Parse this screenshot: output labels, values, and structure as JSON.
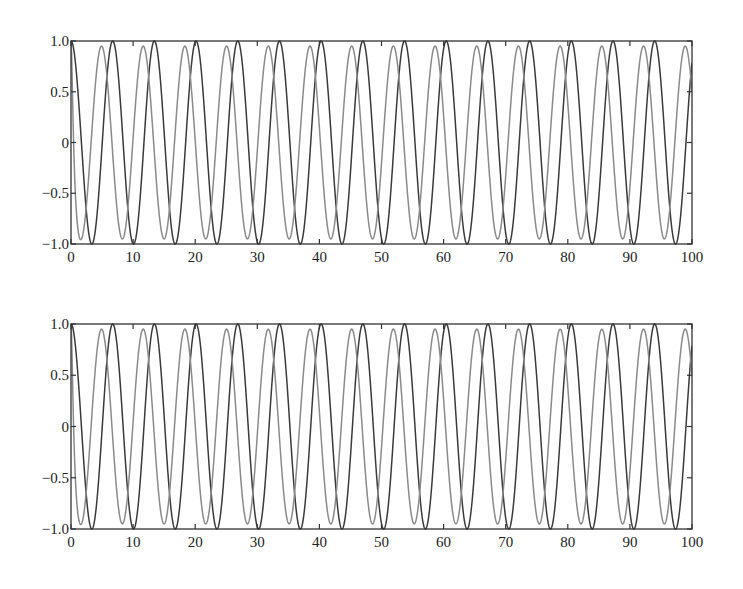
{
  "chart_data": [
    {
      "type": "line",
      "title": "",
      "xlabel": "",
      "ylabel": "",
      "xlim": [
        0,
        100
      ],
      "ylim": [
        -1.0,
        1.0
      ],
      "grid": false,
      "legend": null,
      "x_ticks": [
        0,
        10,
        20,
        30,
        40,
        50,
        60,
        70,
        80,
        90,
        100
      ],
      "x_tick_labels": [
        "0",
        "10",
        "20",
        "30",
        "40",
        "50",
        "60",
        "70",
        "80",
        "90",
        "100"
      ],
      "y_ticks": [
        1.0,
        0.5,
        0,
        -0.5,
        -1.0
      ],
      "y_tick_labels": [
        "1.0",
        "0.5",
        "0",
        "−0.5",
        "−1.0"
      ],
      "series": [
        {
          "name": "dark",
          "color": "#3a3a3a",
          "description": "cosine, amplitude 1.0, period ~6.71, starts at 1.0",
          "amplitude": 1.0,
          "period": 6.714,
          "phase_shift": 0,
          "peaks_x": [
            0,
            6.7,
            13.4,
            20.1,
            26.9,
            33.6,
            40.3,
            47.0,
            53.7,
            60.4,
            67.1,
            73.9,
            80.6,
            87.3,
            94.0
          ],
          "troughs_x": [
            3.4,
            10.1,
            16.8,
            23.5,
            30.2,
            36.9,
            43.6,
            50.4,
            57.1,
            63.8,
            70.5,
            77.2,
            83.9,
            90.6,
            97.3
          ]
        },
        {
          "name": "light",
          "color": "#8a8a8a",
          "description": "cosine, amplitude ~0.95, same period, leads dark curve by ~1.8, starts at 1.0",
          "amplitude": 0.95,
          "period": 6.714,
          "phase_shift": 1.8,
          "peaks_x": [
            5.0,
            11.7,
            18.4,
            25.1,
            31.8,
            38.5,
            45.2,
            51.9,
            58.6,
            65.4,
            72.1,
            78.8,
            85.5,
            92.2,
            98.9
          ],
          "troughs_x": [
            1.6,
            8.3,
            15.0,
            21.7,
            28.5,
            35.2,
            41.9,
            48.6,
            55.3,
            62.0,
            68.7,
            75.4,
            82.2,
            88.9,
            95.6
          ]
        }
      ]
    },
    {
      "type": "line",
      "title": "",
      "xlabel": "",
      "ylabel": "",
      "xlim": [
        0,
        100
      ],
      "ylim": [
        -1.0,
        1.0
      ],
      "grid": false,
      "legend": null,
      "x_ticks": [
        0,
        10,
        20,
        30,
        40,
        50,
        60,
        70,
        80,
        90,
        100
      ],
      "x_tick_labels": [
        "0",
        "10",
        "20",
        "30",
        "40",
        "50",
        "60",
        "70",
        "80",
        "90",
        "100"
      ],
      "y_ticks": [
        1.0,
        0.5,
        0,
        -0.5,
        -1.0
      ],
      "y_tick_labels": [
        "1.0",
        "0.5",
        "0",
        "−0.5",
        "−1.0"
      ],
      "series": [
        {
          "name": "dark",
          "color": "#3a3a3a",
          "description": "cosine, amplitude 1.0, period ~6.71, starts at 1.0",
          "amplitude": 1.0,
          "period": 6.714,
          "phase_shift": 0,
          "peaks_x": [
            0,
            6.7,
            13.4,
            20.1,
            26.9,
            33.6,
            40.3,
            47.0,
            53.7,
            60.4,
            67.1,
            73.9,
            80.6,
            87.3,
            94.0
          ],
          "troughs_x": [
            3.4,
            10.1,
            16.8,
            23.5,
            30.2,
            36.9,
            43.6,
            50.4,
            57.1,
            63.8,
            70.5,
            77.2,
            83.9,
            90.6,
            97.3
          ]
        },
        {
          "name": "light",
          "color": "#8a8a8a",
          "description": "cosine, amplitude ~0.95, same period, leads dark curve by ~1.8, starts at 1.0",
          "amplitude": 0.95,
          "period": 6.714,
          "phase_shift": 1.8,
          "peaks_x": [
            5.0,
            11.7,
            18.4,
            25.1,
            31.8,
            38.5,
            45.2,
            51.9,
            58.6,
            65.4,
            72.1,
            78.8,
            85.5,
            92.2,
            98.9
          ],
          "troughs_x": [
            1.6,
            8.3,
            15.0,
            21.7,
            28.5,
            35.2,
            41.9,
            48.6,
            55.3,
            62.0,
            68.7,
            75.4,
            82.2,
            88.9,
            95.6
          ]
        }
      ]
    }
  ],
  "layout": {
    "panels": [
      {
        "left": 71,
        "top": 41,
        "right": 692,
        "bottom": 244
      },
      {
        "left": 71,
        "top": 324,
        "right": 692,
        "bottom": 529
      }
    ]
  }
}
